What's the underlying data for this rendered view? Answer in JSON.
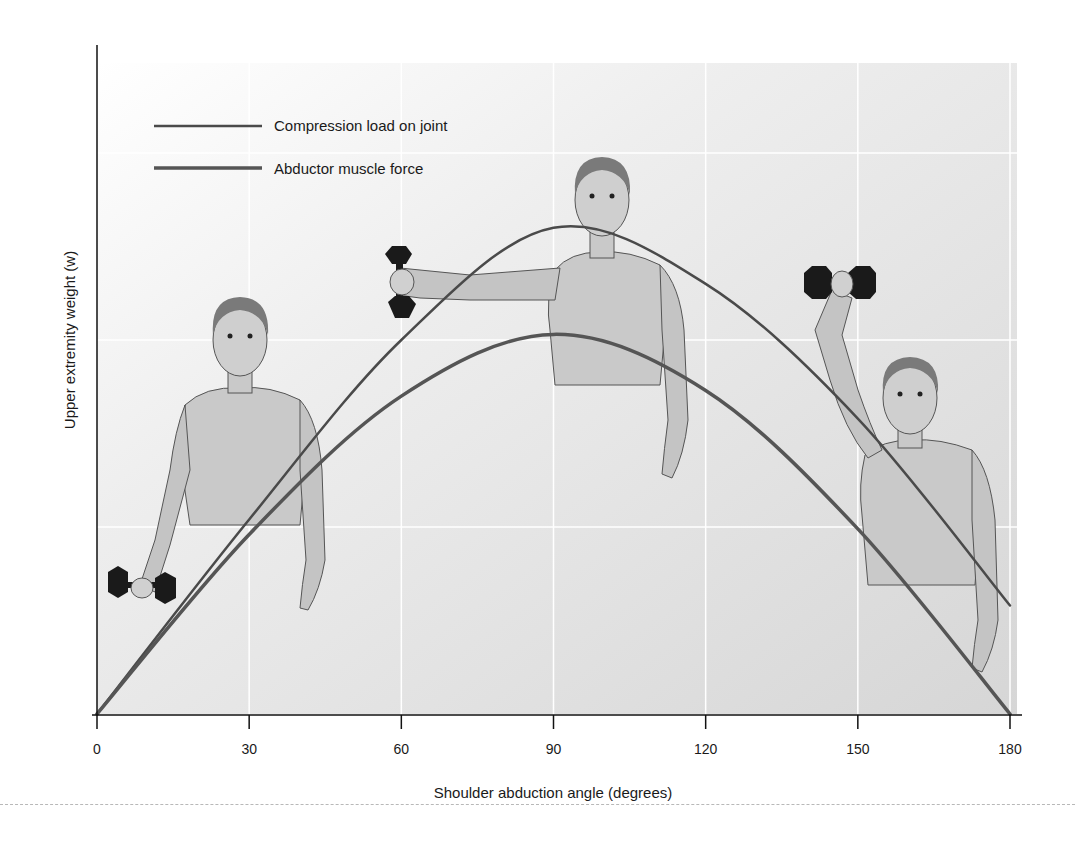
{
  "chart_data": {
    "type": "line",
    "title": "",
    "xlabel": "Shoulder abduction angle (degrees)",
    "ylabel": "Upper extremity weight (w)",
    "x": [
      0,
      30,
      60,
      90,
      120,
      150,
      180
    ],
    "xticks": [
      "0",
      "30",
      "60",
      "90",
      "120",
      "150",
      "180"
    ],
    "xlim": [
      0,
      180
    ],
    "ylim": [
      0,
      3.4
    ],
    "y_units_note": "y axis has no numeric ticks; values normalized so horizontal gridlines fall at 1, 2, 3",
    "grid": true,
    "legend_position": "upper-left",
    "series": [
      {
        "name": "Compression load on joint",
        "values": [
          0,
          1.04,
          2.0,
          2.6,
          2.3,
          1.58,
          0.58
        ],
        "color": "#4a4a4a",
        "line_width": 2.5
      },
      {
        "name": "Abductor muscle force",
        "values": [
          0,
          0.96,
          1.7,
          2.03,
          1.73,
          0.99,
          0
        ],
        "color": "#555555",
        "line_width": 3.5
      }
    ],
    "annotations": [
      "Illustration: figure holding dumbbell at side (~15°)",
      "Illustration: figure with arm abducted horizontally (~90°) holding dumbbell",
      "Illustration: figure with arm raised overhead (~150°) holding dumbbell"
    ]
  },
  "legend": {
    "items": [
      {
        "label": "Compression load on joint"
      },
      {
        "label": "Abductor muscle force"
      }
    ]
  },
  "axes": {
    "x_title": "Shoulder abduction angle (degrees)",
    "y_title": "Upper extremity weight (w)",
    "x_ticks": [
      "0",
      "30",
      "60",
      "90",
      "120",
      "150",
      "180"
    ]
  }
}
